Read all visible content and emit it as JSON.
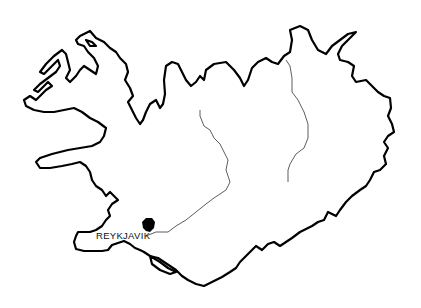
{
  "map": {
    "subject": "Iceland outline map",
    "colors": {
      "coastline": "#000000",
      "rivers": "#333333",
      "background": "#ffffff",
      "city_marker": "#000000"
    },
    "labels": [
      {
        "name": "city-reykjavik",
        "text": "REYKJAVIK"
      }
    ],
    "features": [
      "coastline",
      "river-west",
      "river-east",
      "reykjavik-marker"
    ]
  }
}
